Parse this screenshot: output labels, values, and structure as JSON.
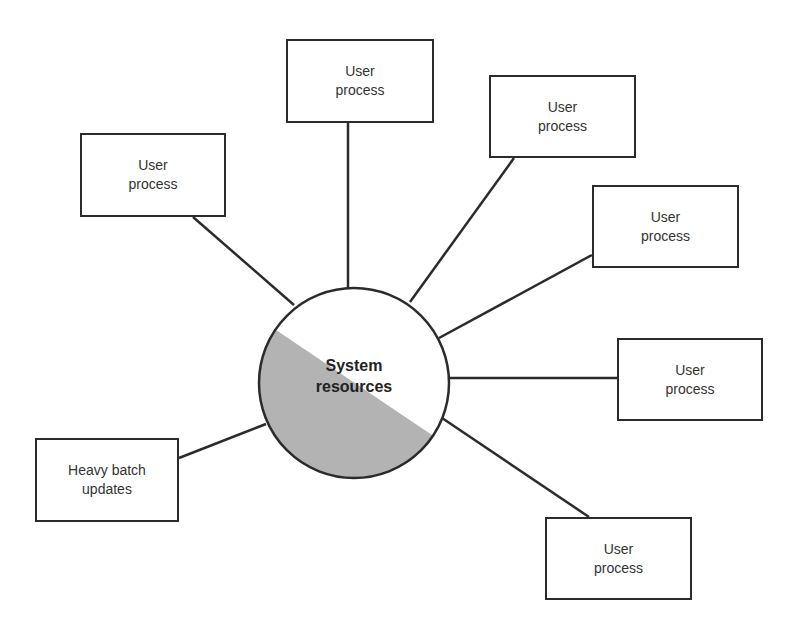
{
  "diagram": {
    "center": {
      "line1": "System",
      "line2": "resources",
      "fill_color": "#b3b3b3",
      "shaded_portion": "lower-left"
    },
    "nodes": [
      {
        "id": "user-process-1",
        "line1": "User",
        "line2": "process"
      },
      {
        "id": "user-process-2",
        "line1": "User",
        "line2": "process"
      },
      {
        "id": "user-process-3",
        "line1": "User",
        "line2": "process"
      },
      {
        "id": "user-process-4",
        "line1": "User",
        "line2": "process"
      },
      {
        "id": "user-process-5",
        "line1": "User",
        "line2": "process"
      },
      {
        "id": "user-process-6",
        "line1": "User",
        "line2": "process"
      },
      {
        "id": "heavy-batch",
        "line1": "Heavy batch",
        "line2": "updates"
      }
    ]
  }
}
